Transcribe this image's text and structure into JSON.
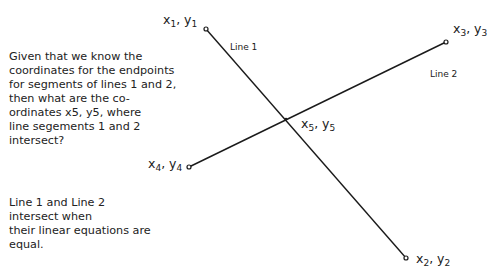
{
  "diagram": {
    "question_text": "Given that we know the\ncoordinates for the endpoints\nfor segments of lines 1 and 2,\nthen what are the co-\nordinates x5, y5, where\nline segements 1 and 2\nintersect?",
    "explanation_text": "Line 1 and Line 2\nintersect when\ntheir linear equations are\nequal.",
    "lines": [
      {
        "label": "Line 1",
        "start": {
          "x": 206,
          "y": 29
        },
        "end": {
          "x": 406,
          "y": 258
        }
      },
      {
        "label": "Line 2",
        "start": {
          "x": 189,
          "y": 167
        },
        "end": {
          "x": 446,
          "y": 42
        }
      }
    ],
    "points": [
      {
        "name": "x1, y1",
        "x_var": "x",
        "x_sub": "1",
        "y_var": "y",
        "y_sub": "1"
      },
      {
        "name": "x2, y2",
        "x_var": "x",
        "x_sub": "2",
        "y_var": "y",
        "y_sub": "2"
      },
      {
        "name": "x3, y3",
        "x_var": "x",
        "x_sub": "3",
        "y_var": "y",
        "y_sub": "3"
      },
      {
        "name": "x4, y4",
        "x_var": "x",
        "x_sub": "4",
        "y_var": "y",
        "y_sub": "4"
      },
      {
        "name": "x5, y5",
        "x_var": "x",
        "x_sub": "5",
        "y_var": "y",
        "y_sub": "5"
      }
    ],
    "line_color": "#1a1a1a",
    "background": "#ffffff"
  }
}
